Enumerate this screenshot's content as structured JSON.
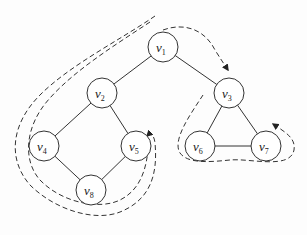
{
  "diagram": {
    "type": "graph-traversal",
    "nodes": [
      {
        "id": "v1",
        "label": "v",
        "sub": "1",
        "x": 163,
        "y": 47
      },
      {
        "id": "v2",
        "label": "v",
        "sub": "2",
        "x": 102,
        "y": 93
      },
      {
        "id": "v3",
        "label": "v",
        "sub": "3",
        "x": 229,
        "y": 93
      },
      {
        "id": "v4",
        "label": "v",
        "sub": "4",
        "x": 44,
        "y": 146
      },
      {
        "id": "v5",
        "label": "v",
        "sub": "5",
        "x": 136,
        "y": 146
      },
      {
        "id": "v6",
        "label": "v",
        "sub": "6",
        "x": 200,
        "y": 146
      },
      {
        "id": "v7",
        "label": "v",
        "sub": "7",
        "x": 266,
        "y": 146
      },
      {
        "id": "v8",
        "label": "v",
        "sub": "8",
        "x": 91,
        "y": 190
      }
    ],
    "edges": [
      [
        "v1",
        "v2"
      ],
      [
        "v1",
        "v3"
      ],
      [
        "v2",
        "v4"
      ],
      [
        "v2",
        "v5"
      ],
      [
        "v4",
        "v8"
      ],
      [
        "v5",
        "v8"
      ],
      [
        "v3",
        "v6"
      ],
      [
        "v3",
        "v7"
      ],
      [
        "v6",
        "v7"
      ]
    ],
    "traversal_paths": [
      {
        "name": "left-loop",
        "description": "dashed double path around v1-v2-v4-v8-v5 with arrow returning at v5"
      },
      {
        "name": "v1-to-v3",
        "description": "dashed arrow from v1 to v3"
      },
      {
        "name": "right-loop",
        "description": "dashed path around v3-v6-v7 with arrow returning toward v3"
      }
    ],
    "colors": {
      "stroke": "#333333",
      "background": "#fdfdfd"
    }
  }
}
